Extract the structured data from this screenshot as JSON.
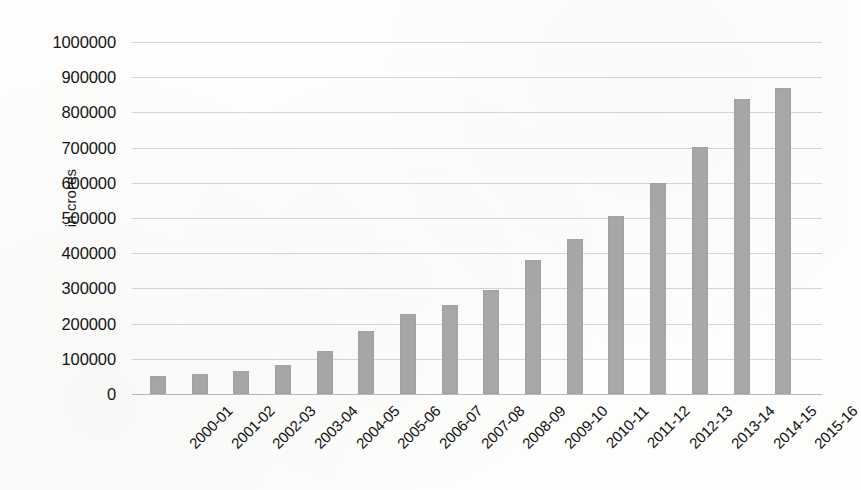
{
  "chart_data": {
    "type": "bar",
    "title": "",
    "subtitle": "",
    "xlabel": "",
    "ylabel": "in crores",
    "ylim": [
      0,
      1000000
    ],
    "ytick_step": 100000,
    "yticks": [
      0,
      100000,
      200000,
      300000,
      400000,
      500000,
      600000,
      700000,
      800000,
      900000,
      1000000
    ],
    "ytick_labels": [
      "0",
      "100000",
      "200000",
      "300000",
      "400000",
      "500000",
      "600000",
      "700000",
      "800000",
      "900000",
      "1000000"
    ],
    "grid": true,
    "grid_axis": "y",
    "legend": false,
    "legend_position": "none",
    "bar_color": "#a8a8a8",
    "grid_color": "#d5d5d5",
    "axis_color": "#b9b9b9",
    "text_color": "#141414",
    "background_color": "#fdfdfc",
    "xtick_label_rotation": -45,
    "categories": [
      "2000-01",
      "2001-02",
      "2002-03",
      "2003-04",
      "2004-05",
      "2005-06",
      "2006-07",
      "2007-08",
      "2008-09",
      "2009-10",
      "2010-11",
      "2011-12",
      "2012-13",
      "2013-14",
      "2014-15",
      "2015-16"
    ],
    "values": [
      51000,
      58000,
      66000,
      83000,
      122000,
      179000,
      227000,
      253000,
      296000,
      380000,
      441000,
      506000,
      599000,
      703000,
      838000,
      870000
    ]
  }
}
